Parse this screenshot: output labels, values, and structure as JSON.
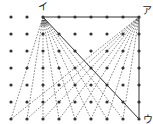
{
  "diagram": {
    "grid": {
      "cols": 9,
      "rows": 7,
      "x0": 11,
      "dx": 16,
      "y0": 17,
      "dy": 17,
      "dot_color": "#333333",
      "dot_radius": 1.6
    },
    "points": {
      "a": {
        "label": "ア",
        "col": 8,
        "row": 0
      },
      "i": {
        "label": "イ",
        "col": 2,
        "row": 0
      },
      "u": {
        "label": "ウ",
        "col": 8,
        "row": 6
      }
    },
    "solid_lines": [
      {
        "from": "i",
        "to": "a"
      },
      {
        "from": "a",
        "to": "u"
      },
      {
        "from": "i",
        "to": "u"
      }
    ],
    "dashed_from_i_to_bottom_cols": [
      0,
      1,
      2,
      3,
      4,
      5,
      6,
      7
    ],
    "dashed_from_a_to_bottom_cols": [
      0,
      1,
      2,
      3,
      4,
      5,
      6,
      7
    ],
    "line_color": "#333333",
    "angle_arcs_at": "i",
    "angle_arc_radii": [
      4,
      5.5,
      7,
      8.5
    ]
  }
}
